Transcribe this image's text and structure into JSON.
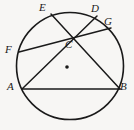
{
  "figure": {
    "width": 134,
    "height": 130,
    "background_color": "#f7f6f4",
    "stroke_color": "#1a1a1a",
    "label_color": "#1a1a1a"
  },
  "circle": {
    "name": "main-circle",
    "center_x": 70,
    "center_y": 66,
    "radius": 53.5,
    "stroke_width": 1.6
  },
  "center_dot": {
    "name": "circle-center-dot",
    "x": 67,
    "y": 67,
    "radius": 1.8
  },
  "points": [
    {
      "id": "E",
      "label": "E",
      "x": 51,
      "y": 14,
      "label_x": 39,
      "label_y": 2
    },
    {
      "id": "D",
      "label": "D",
      "x": 97,
      "y": 16,
      "label_x": 91,
      "label_y": 3
    },
    {
      "id": "G",
      "label": "G",
      "x": 111,
      "y": 28,
      "label_x": 104,
      "label_y": 16
    },
    {
      "id": "F",
      "label": "F",
      "x": 19,
      "y": 52,
      "label_x": 5,
      "label_y": 44
    },
    {
      "id": "C",
      "label": "C",
      "x": 67,
      "y": 38,
      "label_x": 65,
      "label_y": 39
    },
    {
      "id": "A",
      "label": "A",
      "x": 22,
      "y": 89,
      "label_x": 7,
      "label_y": 81
    },
    {
      "id": "B",
      "label": "B",
      "x": 120,
      "y": 89,
      "label_x": 120,
      "label_y": 81
    }
  ],
  "segments": [
    {
      "name": "chord-ab",
      "from": "A",
      "to": "B",
      "x1": 22,
      "y1": 89,
      "x2": 120,
      "y2": 89
    },
    {
      "name": "chord-ad",
      "from": "A",
      "to": "D",
      "x1": 22,
      "y1": 89,
      "x2": 97,
      "y2": 16
    },
    {
      "name": "chord-eb",
      "from": "E",
      "to": "B",
      "x1": 51,
      "y1": 14,
      "x2": 120,
      "y2": 89
    },
    {
      "name": "chord-fg",
      "from": "F",
      "to": "G",
      "x1": 19,
      "y1": 52,
      "x2": 111,
      "y2": 28
    }
  ]
}
